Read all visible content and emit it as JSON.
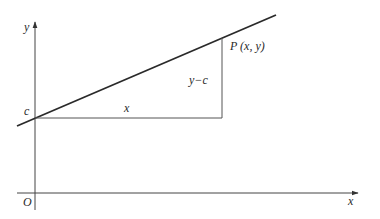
{
  "diagram": {
    "type": "coordinate-geometry",
    "axes": {
      "x_label": "x",
      "y_label": "y",
      "origin_label": "O"
    },
    "intercept_label": "c",
    "run_label": "x",
    "rise_label": "y−c",
    "point_label": "P (x, y)",
    "colors": {
      "line": "#2a2a2a",
      "axes": "#444444",
      "text": "#2a2a2a",
      "background": "#ffffff"
    }
  }
}
